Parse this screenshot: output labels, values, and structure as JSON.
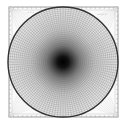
{
  "diagram": {
    "type": "polar-grid-test-pattern",
    "frame": {
      "x": 9,
      "y": 7,
      "width": 109,
      "height": 110,
      "stroke": "#888888"
    },
    "circle": {
      "cx": 63,
      "cy": 62,
      "r": 55,
      "stroke": "#333333",
      "stroke_width": 1.4
    },
    "radial_lines": 120,
    "rings": 28,
    "center_color": "#000000",
    "grid_color": "#555555",
    "labels": {
      "top_left": "~~~",
      "top_right": "~~~~"
    }
  }
}
